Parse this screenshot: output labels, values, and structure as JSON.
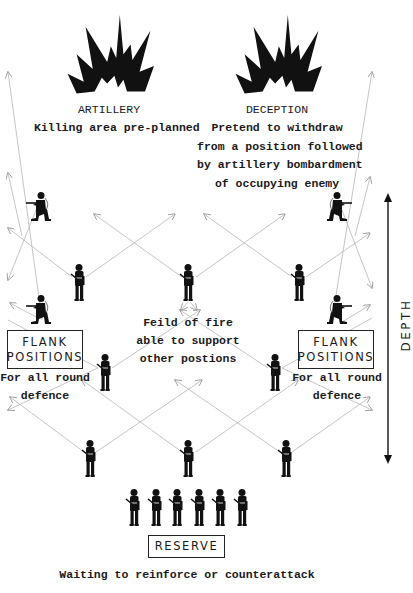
{
  "diagram": {
    "type": "military defensive position diagram",
    "artillery": {
      "title": "ARTILLERY",
      "subtitle": "Killing area pre-planned",
      "icon": "explosion-icon"
    },
    "deception": {
      "title": "DECEPTION",
      "lines": [
        "Pretend to withdraw",
        "from a position followed",
        "by artillery bombardment",
        "of occupying enemy"
      ],
      "icon": "explosion-icon"
    },
    "field_of_fire": {
      "lines": [
        "Feild of fire",
        "able to support",
        "other postions"
      ]
    },
    "flank_left": {
      "box_lines": [
        "FLANK",
        "POSITIONS"
      ],
      "caption_lines": [
        "For all round",
        "defence"
      ]
    },
    "flank_right": {
      "box_lines": [
        "FLANK",
        "POSITIONS"
      ],
      "caption_lines": [
        "For all round",
        "defence"
      ]
    },
    "reserve": {
      "label": "RESERVE",
      "caption": "Waiting to reinforce or counterattack",
      "soldier_count": 6
    },
    "depth": {
      "label": "DEPTH"
    },
    "colors": {
      "ink": "#111111",
      "arrow_line": "#b8b8b8",
      "background": "#ffffff"
    }
  }
}
